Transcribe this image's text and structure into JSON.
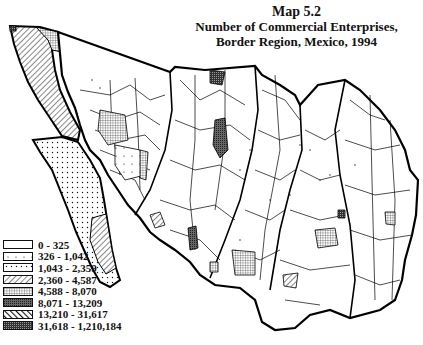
{
  "figure": {
    "title": "Map 5.2",
    "subtitle_line1": "Number of Commercial Enterprises,",
    "subtitle_line2": "Border Region, Mexico, 1994"
  },
  "legend": {
    "classes": [
      {
        "label": "0 - 325",
        "pattern": "blank"
      },
      {
        "label": "326 - 1,042",
        "pattern": "sparse-dots"
      },
      {
        "label": "1,043 - 2,359",
        "pattern": "dots"
      },
      {
        "label": "2,360 - 4,587",
        "pattern": "diagonal-hatch"
      },
      {
        "label": "4,588 - 8,070",
        "pattern": "fine-grid"
      },
      {
        "label": "8,071 - 13,209",
        "pattern": "dense-stipple"
      },
      {
        "label": "13,210 - 31,617",
        "pattern": "bold-diagonal"
      },
      {
        "label": "31,618 - 1,210,184",
        "pattern": "dark-grid"
      }
    ]
  },
  "regions": [
    {
      "name": "Baja California",
      "class": "diagonal-hatch"
    },
    {
      "name": "Baja California Sur",
      "class": "dots"
    },
    {
      "name": "Sonora",
      "class": "mixed"
    },
    {
      "name": "Chihuahua",
      "class": "mixed"
    },
    {
      "name": "Coahuila",
      "class": "mixed"
    },
    {
      "name": "Nuevo Leon",
      "class": "mixed"
    },
    {
      "name": "Tamaulipas",
      "class": "mixed"
    }
  ]
}
